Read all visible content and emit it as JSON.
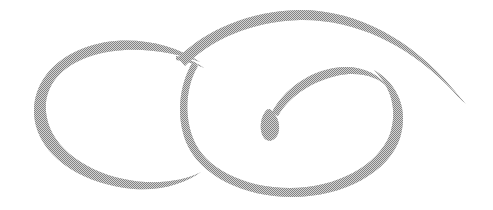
{
  "artwork": {
    "title": "Calligraphic Flourish Ornament",
    "kind": "hand-drawn decorative swirl",
    "canvas": {
      "width": 493,
      "height": 210,
      "background_color": "#ffffff"
    },
    "ink": {
      "color": "#8a8a8a",
      "texture": "dithered halftone",
      "dither_light": "#ffffff",
      "dither_dark": "#6f6f6f"
    },
    "strokes": [
      {
        "name": "left-loop",
        "description": "open oval loop on the left, thick at top, tapering to a point at lower right",
        "path": "M 200 62 C 168 40, 120 34, 84 48 C 44 63, 28 96, 36 126 C 45 160, 86 185, 134 189 C 162 191, 186 183, 201 172 C 188 179, 168 183, 146 182 C 104 180, 62 158, 50 128 C 38 98, 52 70, 88 57 C 124 44, 170 50, 200 62 Z"
      },
      {
        "name": "outer-top-sweep",
        "description": "large arc sweeping from lower-left crossing up over the top and down to a tapered tail at upper right",
        "path": "M 178 58 C 205 30, 250 11, 298 10 C 356 9, 412 40, 452 88 C 459 96, 463 101, 466 104 C 461 100, 455 93, 446 84 C 406 44, 354 19, 300 20 C 252 21, 210 40, 185 66 Z"
      },
      {
        "name": "right-loop",
        "description": "large open oval loop on the right, from the crossing down around the bottom and up the right side into the inner spiral",
        "path": "M 192 63 C 179 86, 176 116, 186 142 C 200 176, 244 197, 292 197 C 344 197, 389 172, 400 138 C 409 110, 398 84, 374 70 C 391 87, 398 110, 390 134 C 378 166, 336 188, 290 188 C 244 188, 204 168, 193 138 C 184 114, 186 86, 198 66 Z"
      },
      {
        "name": "inner-spiral",
        "description": "inner spiral curve rising from the teardrop bulb, arcing right and curving down into the right loop",
        "path": "M 272 112 C 284 90, 308 72, 334 68 C 358 64, 378 72, 388 88 C 378 76, 358 71, 336 76 C 310 82, 288 98, 278 116 Z"
      },
      {
        "name": "teardrop-terminal",
        "description": "teardrop shaped bulb at the center, the terminal of the spiral",
        "path": "M 271 110 C 278 116, 281 126, 278 134 C 275 141, 268 143, 264 138 C 259 131, 260 119, 265 112 C 267 109, 269 108, 271 110 Z"
      },
      {
        "name": "crossing-stub",
        "description": "short stroke stub at the crossing point where the loops intersect",
        "path": "M 176 56 C 186 58, 196 62, 204 68 C 196 64, 186 61, 176 60 Z"
      }
    ]
  }
}
